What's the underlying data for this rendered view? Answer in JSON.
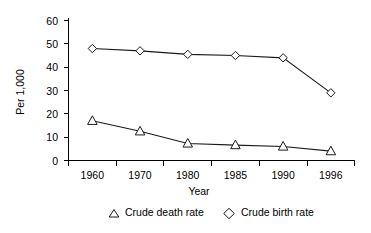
{
  "chart_data": {
    "type": "line",
    "title": "",
    "xlabel": "Year",
    "ylabel": "Per 1,000",
    "categories": [
      "1960",
      "1970",
      "1980",
      "1985",
      "1990",
      "1996"
    ],
    "ylim": [
      0,
      60
    ],
    "yticks": [
      "0",
      "10",
      "20",
      "30",
      "40",
      "50",
      "60"
    ],
    "grid": false,
    "legend_position": "bottom",
    "series": [
      {
        "name": "Crude death rate",
        "marker": "triangle",
        "values": [
          17,
          12.5,
          7.3,
          6.6,
          6,
          4
        ]
      },
      {
        "name": "Crude birth rate",
        "marker": "diamond",
        "values": [
          48,
          47,
          45.5,
          45,
          44,
          29
        ]
      }
    ]
  },
  "colors": {
    "line": "#1a1a1a",
    "marker_fill": "#ffffff",
    "axis": "#000000",
    "background": "#ffffff"
  }
}
